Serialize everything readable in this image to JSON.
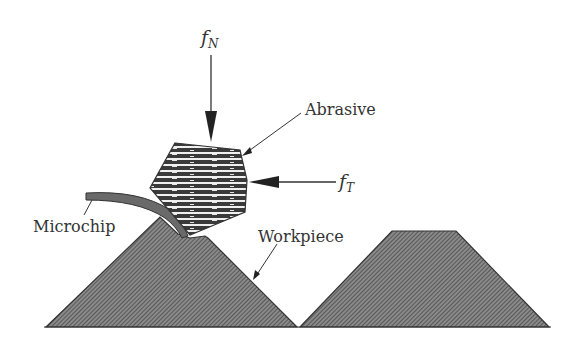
{
  "diagram": {
    "labels": {
      "normal_force": {
        "symbol": "f",
        "subscript": "N"
      },
      "tangential_force": {
        "symbol": "f",
        "subscript": "T"
      },
      "abrasive": "Abrasive",
      "microchip": "Microchip",
      "workpiece": "Workpiece"
    },
    "colors": {
      "fill_hatch": "#6b6b6b",
      "outline": "#333333",
      "abrasive_dark": "#3a3a3a",
      "abrasive_light": "#f2f2f2"
    }
  }
}
